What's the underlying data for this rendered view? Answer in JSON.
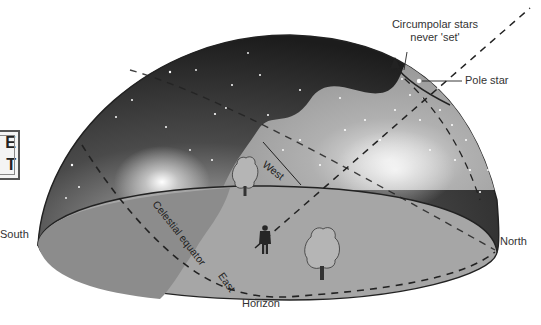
{
  "diagram": {
    "type": "celestial-sphere",
    "labels": {
      "circumpolar_line1": "Circumpolar stars",
      "circumpolar_line2": "never 'set'",
      "pole_star": "Pole star",
      "north": "North",
      "south": "South",
      "horizon": "Horizon",
      "west": "West",
      "east": "East",
      "celestial_equator": "Celestial equator"
    },
    "badge": {
      "line1": "E",
      "line2": "T"
    },
    "colors": {
      "night_sky_dark": "#1f1f1f",
      "night_sky_mid": "#4a4a4a",
      "visible_sky": "#9a9a9a",
      "ground": "#a8a8a8",
      "ground_dark": "#8a8a8a",
      "outline": "#222222",
      "label_text": "#333333"
    },
    "icons": [
      "person-icon",
      "tree-icon",
      "pole-star-icon",
      "arrow-icon"
    ]
  }
}
